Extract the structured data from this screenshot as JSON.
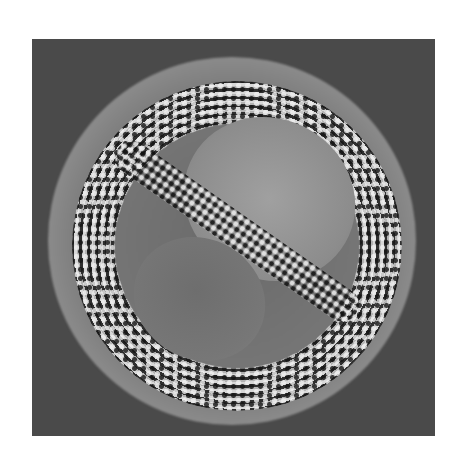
{
  "image": {
    "subject": "micrograph of a spherical pollen grain with reticulate/echinate surface ornamentation",
    "colors": {
      "page_background": "#ffffff",
      "image_background": "#4a4a4a",
      "highlight": "#e8e8e8",
      "shadow": "#222222"
    }
  }
}
